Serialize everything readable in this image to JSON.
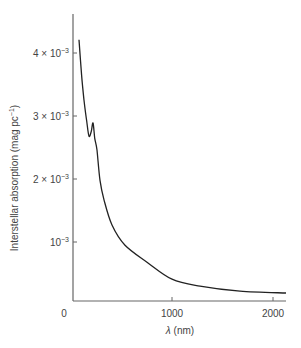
{
  "chart_data": {
    "type": "line",
    "title": "",
    "xlabel": "λ (nm)",
    "ylabel": "Interstellar absorption (mag pc⁻¹)",
    "xlim": [
      0,
      2130
    ],
    "ylim": [
      0,
      0.0046
    ],
    "grid": false,
    "legend": null,
    "x_ticks": [
      {
        "value": 0,
        "label": "0"
      },
      {
        "value": 1000,
        "label": "1000"
      },
      {
        "value": 2000,
        "label": "2000"
      }
    ],
    "y_ticks": [
      {
        "value": 0.001,
        "label_base": "10",
        "label_mult": "",
        "label_exp": "−3"
      },
      {
        "value": 0.002,
        "label_base": "10",
        "label_mult": "2 × ",
        "label_exp": "−3"
      },
      {
        "value": 0.003,
        "label_base": "10",
        "label_mult": "3 × ",
        "label_exp": "−3"
      },
      {
        "value": 0.004,
        "label_base": "10",
        "label_mult": "4 × ",
        "label_exp": "−3"
      }
    ],
    "series": [
      {
        "name": "Interstellar absorption",
        "color": "#222222",
        "x": [
          79,
          105,
          129,
          155,
          178,
          200,
          218,
          235,
          257,
          287,
          327,
          406,
          535,
          752,
          1000,
          1277,
          1673,
          2129
        ],
        "y": [
          0.00421,
          0.00365,
          0.00325,
          0.00292,
          0.00268,
          0.00275,
          0.00289,
          0.00265,
          0.00246,
          0.00198,
          0.00167,
          0.00127,
          0.00095,
          0.00068,
          0.00041,
          0.0003,
          0.00022,
          0.00019
        ]
      }
    ]
  },
  "labels": {
    "x_axis": "λ (nm)",
    "y_axis_main": "Interstellar absorption (mag pc",
    "y_axis_exp": "−1",
    "y_axis_close": ")",
    "origin": "0"
  }
}
